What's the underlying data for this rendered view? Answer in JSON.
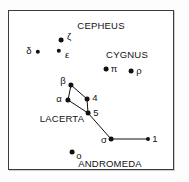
{
  "figure": {
    "kind": "star-chart",
    "background_color": "#ffffff",
    "frame_color": "#3b3b3b",
    "star_color": "#111111",
    "line_color": "#111111"
  },
  "constellation_names": [
    {
      "name": "constellation-name-cepheus",
      "text": "CEPHEUS",
      "x": 92,
      "y": 15
    },
    {
      "name": "constellation-name-cygnus",
      "text": "CYGNUS",
      "x": 118,
      "y": 44
    },
    {
      "name": "constellation-name-lacerta",
      "text": "LACERTA",
      "x": 53,
      "y": 108
    },
    {
      "name": "constellation-name-andromeda",
      "text": "ANDROMEDA",
      "x": 101,
      "y": 153
    }
  ],
  "stars": [
    {
      "name": "star-cepheus-zeta",
      "label": "ζ",
      "x": 52,
      "y": 29,
      "r": 2.4,
      "lx": 60,
      "ly": 26
    },
    {
      "name": "star-cepheus-epsilon",
      "label": "ε",
      "x": 50,
      "y": 40,
      "r": 2.2,
      "lx": 58,
      "ly": 44
    },
    {
      "name": "star-cepheus-delta",
      "label": "δ",
      "x": 29,
      "y": 41,
      "r": 2.2,
      "lx": 20,
      "ly": 40
    },
    {
      "name": "star-cygnus-pi",
      "label": "π",
      "x": 97,
      "y": 58,
      "r": 2.4,
      "lx": 105,
      "ly": 58
    },
    {
      "name": "star-cygnus-rho",
      "label": "ρ",
      "x": 122,
      "y": 60,
      "r": 2.4,
      "lx": 130,
      "ly": 60
    },
    {
      "name": "star-lacerta-beta",
      "label": "β",
      "x": 62,
      "y": 74,
      "r": 2.6,
      "lx": 54,
      "ly": 70
    },
    {
      "name": "star-lacerta-alpha",
      "label": "α",
      "x": 59,
      "y": 89,
      "r": 2.6,
      "lx": 50,
      "ly": 88
    },
    {
      "name": "star-lacerta-4",
      "label": "4",
      "x": 78,
      "y": 88,
      "r": 2.4,
      "lx": 86,
      "ly": 87
    },
    {
      "name": "star-lacerta-5",
      "label": "5",
      "x": 79,
      "y": 102,
      "r": 2.4,
      "lx": 87,
      "ly": 102
    },
    {
      "name": "star-lacerta-sigma",
      "label": "σ",
      "x": 102,
      "y": 128,
      "r": 2.4,
      "lx": 95,
      "ly": 129
    },
    {
      "name": "star-lacerta-1",
      "label": "1",
      "x": 139,
      "y": 128,
      "r": 2.0,
      "lx": 146,
      "ly": 128
    },
    {
      "name": "star-andromeda-omicron",
      "label": "ο",
      "x": 63,
      "y": 141,
      "r": 2.4,
      "lx": 70,
      "ly": 145
    }
  ],
  "constellation_lines": [
    {
      "name": "line-beta-alpha",
      "x1": 62,
      "y1": 74,
      "x2": 59,
      "y2": 89
    },
    {
      "name": "line-beta-4",
      "x1": 62,
      "y1": 74,
      "x2": 78,
      "y2": 88
    },
    {
      "name": "line-4-5",
      "x1": 78,
      "y1": 88,
      "x2": 79,
      "y2": 102
    },
    {
      "name": "line-alpha-5",
      "x1": 59,
      "y1": 89,
      "x2": 79,
      "y2": 102
    },
    {
      "name": "line-5-sigma",
      "x1": 79,
      "y1": 102,
      "x2": 102,
      "y2": 128
    },
    {
      "name": "line-sigma-1",
      "x1": 102,
      "y1": 128,
      "x2": 139,
      "y2": 128
    }
  ]
}
